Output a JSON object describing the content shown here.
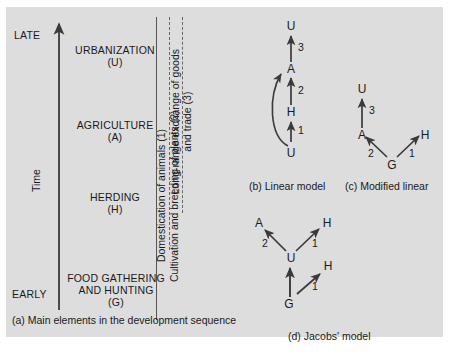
{
  "figure": {
    "background_color": "#dddddd",
    "ink_color": "#1a1a1a"
  },
  "panel_a": {
    "caption": "(a) Main elements in the development sequence",
    "axis": {
      "name": "Time",
      "top_label": "LATE",
      "bottom_label": "EARLY",
      "direction": "upward"
    },
    "stages": [
      {
        "name": "URBANIZATION",
        "code": "(U)"
      },
      {
        "name": "AGRICULTURE",
        "code": "(A)"
      },
      {
        "name": "HERDING",
        "code": "(H)"
      },
      {
        "name": "FOOD GATHERING",
        "name2": "AND HUNTING",
        "code": "(G)"
      }
    ],
    "innovations": [
      {
        "label": "Domestication of animals (1)"
      },
      {
        "label": "Cultivation and breeding of plants (2)"
      },
      {
        "label": "Long-range exchange of goods",
        "label2": "and trade (3)"
      }
    ]
  },
  "panel_b": {
    "caption": "(b) Linear model",
    "nodes": {
      "top": "U",
      "second": "A",
      "third": "H",
      "bottom": "U"
    },
    "arrow_labels": {
      "upper": "3",
      "middle": "2",
      "lower": "1"
    }
  },
  "panel_c": {
    "caption": "(c) Modified linear",
    "nodes": {
      "top": "U",
      "left": "A",
      "right": "H",
      "bottom": "G"
    },
    "arrow_labels": {
      "vertical": "3",
      "left_diag": "2",
      "right_diag": "1"
    }
  },
  "panel_d": {
    "caption": "(d) Jacobs' model",
    "nodes": {
      "upper_left": "A",
      "upper_right": "H",
      "center": "U",
      "lower_right": "H",
      "bottom": "G"
    },
    "arrow_labels": {
      "to_a": "2",
      "to_h_upper": "1",
      "to_h_lower": "1"
    }
  }
}
